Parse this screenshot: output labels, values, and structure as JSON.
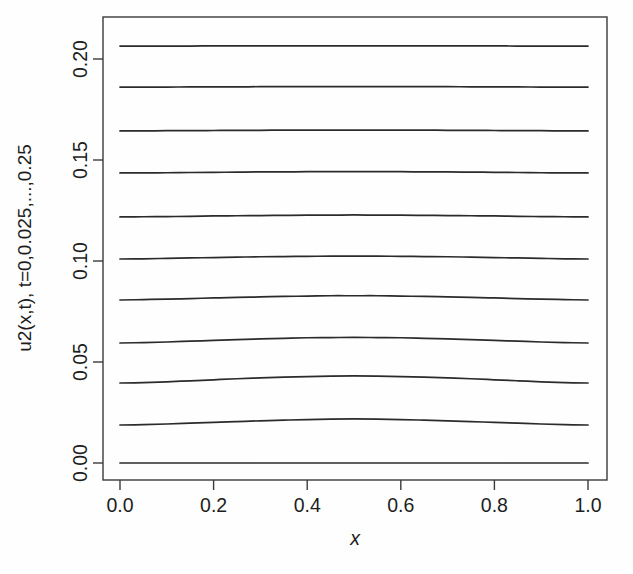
{
  "figure": {
    "width": 633,
    "height": 574,
    "background_color": "#fefefe",
    "line_color": "#2b2b2b",
    "axis_color": "#3a3a3a",
    "text_color": "#1d1d1d"
  },
  "chart_data": {
    "type": "line",
    "title": "",
    "subtitle": "",
    "xlabel": "x",
    "ylabel": "u2(x,t), t=0,0.025,...,0.25",
    "xlim": [
      0.0,
      1.0
    ],
    "ylim": [
      0.0,
      0.2064
    ],
    "grid": false,
    "legend": "none",
    "xticks": [
      0.0,
      0.2,
      0.4,
      0.6,
      0.8,
      1.0
    ],
    "xticklabels": [
      "0.0",
      "0.2",
      "0.4",
      "0.6",
      "0.8",
      "1.0"
    ],
    "yticks": [
      0.0,
      0.05,
      0.1,
      0.15,
      0.2
    ],
    "yticklabels": [
      "0.00",
      "0.05",
      "0.10",
      "0.15",
      "0.20"
    ],
    "x": [
      0.0,
      0.05,
      0.1,
      0.15,
      0.2,
      0.25,
      0.3,
      0.35,
      0.4,
      0.45,
      0.5,
      0.55,
      0.6,
      0.65,
      0.7,
      0.75,
      0.8,
      0.85,
      0.9,
      0.95,
      1.0
    ],
    "series": [
      {
        "name": "t=0",
        "t": 0.0,
        "values": [
          0.0,
          0.0,
          0.0,
          0.0,
          0.0,
          0.0,
          0.0,
          0.0,
          0.0,
          0.0,
          0.0,
          0.0,
          0.0,
          0.0,
          0.0,
          0.0,
          0.0,
          0.0,
          0.0,
          0.0,
          0.0
        ]
      },
      {
        "name": "t=0.025",
        "t": 0.025,
        "values": [
          0.0188,
          0.019,
          0.0193,
          0.0197,
          0.0201,
          0.0205,
          0.0209,
          0.0212,
          0.0215,
          0.0217,
          0.0218,
          0.0217,
          0.0215,
          0.0212,
          0.0209,
          0.0205,
          0.0201,
          0.0197,
          0.0193,
          0.019,
          0.0188
        ]
      },
      {
        "name": "t=0.05",
        "t": 0.05,
        "values": [
          0.0396,
          0.0398,
          0.0402,
          0.0407,
          0.0412,
          0.0417,
          0.0421,
          0.0425,
          0.0428,
          0.043,
          0.0431,
          0.043,
          0.0428,
          0.0425,
          0.0421,
          0.0417,
          0.0412,
          0.0407,
          0.0402,
          0.0398,
          0.0396
        ]
      },
      {
        "name": "t=0.075",
        "t": 0.075,
        "values": [
          0.0594,
          0.0596,
          0.0599,
          0.0603,
          0.0607,
          0.0611,
          0.0614,
          0.0617,
          0.062,
          0.0621,
          0.0622,
          0.0621,
          0.062,
          0.0617,
          0.0614,
          0.0611,
          0.0607,
          0.0603,
          0.0599,
          0.0596,
          0.0594
        ]
      },
      {
        "name": "t=0.1",
        "t": 0.1,
        "values": [
          0.0807,
          0.0809,
          0.0811,
          0.0814,
          0.0817,
          0.082,
          0.0822,
          0.0825,
          0.0826,
          0.0828,
          0.0828,
          0.0828,
          0.0826,
          0.0825,
          0.0822,
          0.082,
          0.0817,
          0.0814,
          0.0811,
          0.0809,
          0.0807
        ]
      },
      {
        "name": "t=0.125",
        "t": 0.125,
        "values": [
          0.101,
          0.1011,
          0.1013,
          0.1015,
          0.1017,
          0.1019,
          0.1021,
          0.1022,
          0.1023,
          0.1024,
          0.1024,
          0.1024,
          0.1023,
          0.1022,
          0.1021,
          0.1019,
          0.1017,
          0.1015,
          0.1013,
          0.1011,
          0.101
        ]
      },
      {
        "name": "t=0.15",
        "t": 0.15,
        "values": [
          0.1218,
          0.1219,
          0.122,
          0.1221,
          0.1223,
          0.1224,
          0.1225,
          0.1226,
          0.1227,
          0.1227,
          0.1228,
          0.1227,
          0.1227,
          0.1226,
          0.1225,
          0.1224,
          0.1223,
          0.1221,
          0.122,
          0.1219,
          0.1218
        ]
      },
      {
        "name": "t=0.175",
        "t": 0.175,
        "values": [
          0.1436,
          0.1436,
          0.1437,
          0.1438,
          0.1439,
          0.144,
          0.1441,
          0.1441,
          0.1442,
          0.1442,
          0.1442,
          0.1442,
          0.1442,
          0.1441,
          0.1441,
          0.144,
          0.1439,
          0.1438,
          0.1437,
          0.1436,
          0.1436
        ]
      },
      {
        "name": "t=0.2",
        "t": 0.2,
        "values": [
          0.1644,
          0.1644,
          0.1645,
          0.1645,
          0.1646,
          0.1647,
          0.1647,
          0.1648,
          0.1648,
          0.1648,
          0.1648,
          0.1648,
          0.1648,
          0.1648,
          0.1647,
          0.1647,
          0.1646,
          0.1645,
          0.1645,
          0.1644,
          0.1644
        ]
      },
      {
        "name": "t=0.225",
        "t": 0.225,
        "values": [
          0.1861,
          0.1861,
          0.1861,
          0.1862,
          0.1862,
          0.1862,
          0.1863,
          0.1863,
          0.1863,
          0.1863,
          0.1863,
          0.1863,
          0.1863,
          0.1863,
          0.1863,
          0.1862,
          0.1862,
          0.1862,
          0.1861,
          0.1861,
          0.1861
        ]
      },
      {
        "name": "t=0.25",
        "t": 0.25,
        "values": [
          0.2064,
          0.2064,
          0.2064,
          0.2064,
          0.2065,
          0.2065,
          0.2065,
          0.2065,
          0.2065,
          0.2065,
          0.2065,
          0.2065,
          0.2065,
          0.2065,
          0.2065,
          0.2065,
          0.2065,
          0.2064,
          0.2064,
          0.2064,
          0.2064
        ]
      }
    ]
  }
}
